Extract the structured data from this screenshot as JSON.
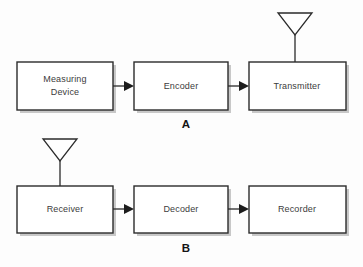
{
  "diagram": {
    "background_color": "#fdfdfd",
    "box_stroke_color": "#2b2b2b",
    "box_fill_color": "#ffffff",
    "label_color": "#3c3c3c",
    "section_label_color": "#141414",
    "sections": [
      {
        "id": "A",
        "label": "A",
        "label_x": 186,
        "label_y": 125,
        "blocks": [
          {
            "id": "measuring-device",
            "lines": [
              "Measuring",
              "Device"
            ],
            "x": 17,
            "y": 62,
            "w": 96,
            "h": 48,
            "antenna": false
          },
          {
            "id": "encoder",
            "lines": [
              "Encoder"
            ],
            "x": 134,
            "y": 62,
            "w": 94,
            "h": 48,
            "antenna": false
          },
          {
            "id": "transmitter",
            "lines": [
              "Transmitter"
            ],
            "x": 249,
            "y": 62,
            "w": 97,
            "h": 48,
            "antenna": true,
            "antenna_x": 295,
            "antenna_top": 13,
            "antenna_half_width": 17,
            "antenna_height": 22
          }
        ],
        "arrows": [
          {
            "id": "arrow-measuring-to-encoder",
            "x1": 113,
            "x2": 134,
            "y": 86
          },
          {
            "id": "arrow-encoder-to-transmitter",
            "x1": 228,
            "x2": 249,
            "y": 86
          }
        ]
      },
      {
        "id": "B",
        "label": "B",
        "label_x": 186,
        "label_y": 249,
        "blocks": [
          {
            "id": "receiver",
            "lines": [
              "Receiver"
            ],
            "x": 17,
            "y": 186,
            "w": 96,
            "h": 47,
            "antenna": true,
            "antenna_x": 60,
            "antenna_top": 139,
            "antenna_half_width": 17,
            "antenna_height": 22
          },
          {
            "id": "decoder",
            "lines": [
              "Decoder"
            ],
            "x": 134,
            "y": 186,
            "w": 94,
            "h": 47,
            "antenna": false
          },
          {
            "id": "recorder",
            "lines": [
              "Recorder"
            ],
            "x": 249,
            "y": 186,
            "w": 97,
            "h": 47,
            "antenna": false
          }
        ],
        "arrows": [
          {
            "id": "arrow-receiver-to-decoder",
            "x1": 113,
            "x2": 134,
            "y": 209
          },
          {
            "id": "arrow-decoder-to-recorder",
            "x1": 228,
            "x2": 249,
            "y": 209
          }
        ]
      }
    ]
  }
}
